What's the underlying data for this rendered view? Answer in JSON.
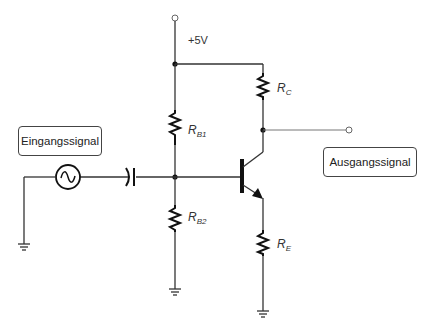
{
  "diagram": {
    "supply": {
      "label": "+5V"
    },
    "input_box": {
      "label": "Eingangssignal"
    },
    "output_box": {
      "label": "Ausgangssignal"
    },
    "components": {
      "rb1": {
        "main": "R",
        "sub": "B1"
      },
      "rb2": {
        "main": "R",
        "sub": "B2"
      },
      "rc": {
        "main": "R",
        "sub": "C"
      },
      "re": {
        "main": "R",
        "sub": "E"
      }
    },
    "symbols": {
      "source": "ac-voltage-source-icon",
      "capacitor": "coupling-capacitor-icon",
      "transistor": "npn-transistor-icon",
      "ground": "ground-icon"
    },
    "colors": {
      "wire": "#333333",
      "background": "#ffffff"
    }
  }
}
